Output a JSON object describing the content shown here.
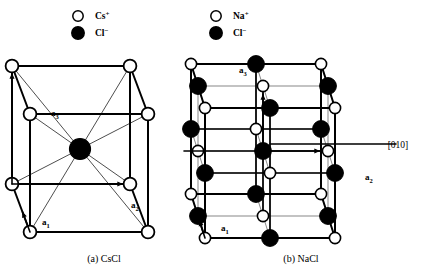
{
  "figure": {
    "background_color": "#ffffff",
    "ion_white_fill": "#ffffff",
    "ion_black_fill": "#000000",
    "stroke_color": "#000000",
    "interior_line_color": "#555555"
  },
  "panels": [
    {
      "id": "cscl",
      "caption": "(a) CsCl",
      "caption_x": 104,
      "caption_y": 262,
      "legend": [
        {
          "marker": "open-circle",
          "ion": "Cl",
          "element": "Cs",
          "charge": "+",
          "label": "Cs+",
          "cx": 78,
          "cy": 16,
          "r": 5.2
        },
        {
          "marker": "filled-circle",
          "ion": "Cl",
          "element": "Cl",
          "charge": "−",
          "label": "Cl−",
          "cx": 78,
          "cy": 33,
          "r": 6.2
        }
      ],
      "cube": {
        "origin_x": 30,
        "origin_y": 232,
        "side": 118,
        "depth_x": -18,
        "depth_y": -48,
        "corner_radius": 6.4,
        "center_radius": 10.5
      },
      "axes": [
        {
          "name": "a1",
          "base": "a",
          "sub": "1",
          "label_x": 42,
          "label_y": 225,
          "dir": "depth"
        },
        {
          "name": "a2",
          "base": "a",
          "sub": "2",
          "label_x": 131,
          "label_y": 208,
          "dir": "x"
        },
        {
          "name": "a3",
          "base": "a",
          "sub": "3",
          "label_x": 51,
          "label_y": 116,
          "dir": "y"
        }
      ]
    },
    {
      "id": "nacl",
      "caption": "(b) NaCl",
      "caption_x": 301,
      "caption_y": 262,
      "legend": [
        {
          "marker": "open-circle",
          "ion": "Na",
          "element": "Na",
          "charge": "+",
          "label": "Na+",
          "cx": 216,
          "cy": 16,
          "r": 5.2
        },
        {
          "marker": "filled-circle",
          "ion": "Cl",
          "element": "Cl",
          "charge": "−",
          "label": "Cl−",
          "cx": 216,
          "cy": 33,
          "r": 6.2
        }
      ],
      "cube": {
        "origin_x": 205,
        "origin_y": 238,
        "side": 130,
        "depth_x": -14,
        "depth_y": -44,
        "divisions": 2,
        "white_radius": 5.6,
        "black_radius": 8.4
      },
      "axes": [
        {
          "name": "a1",
          "base": "a",
          "sub": "1",
          "label_x": 221,
          "label_y": 231,
          "dir": "depth"
        },
        {
          "name": "a2",
          "base": "a",
          "sub": "2",
          "label_x": 365,
          "label_y": 180,
          "dir": "x"
        },
        {
          "name": "a3",
          "base": "a",
          "sub": "3",
          "label_x": 239,
          "label_y": 73,
          "dir": "y"
        }
      ],
      "direction_marker": {
        "label": "[010]",
        "label_x": 398,
        "label_y": 148,
        "line_y": 144,
        "line_x1": 270,
        "line_x2": 396
      }
    }
  ]
}
